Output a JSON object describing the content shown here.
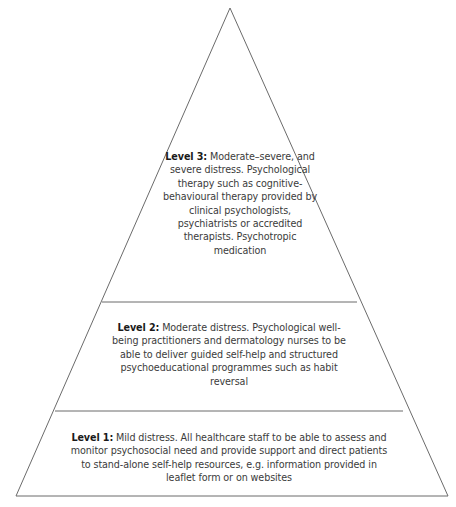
{
  "diagram": {
    "type": "pyramid",
    "colors": {
      "stroke": "#6b6b6b",
      "text": "#3b3b3b",
      "label": "#1a1a1a",
      "background": "#ffffff"
    },
    "levels": [
      {
        "id": "level-3",
        "position": "top",
        "label": "Level 3:",
        "text": " Moderate–severe, and severe distress. Psychological therapy such as cognitive-behavioural therapy provided by clinical psychologists, psychiatrists or accredited therapists. Psychotropic medication"
      },
      {
        "id": "level-2",
        "position": "middle",
        "label": "Level 2:",
        "text": " Moderate distress. Psychological well-being practitioners and dermatology nurses to be able to deliver guided self-help and structured psychoeducational programmes such as habit reversal"
      },
      {
        "id": "level-1",
        "position": "bottom",
        "label": "Level 1:",
        "text": " Mild distress. All healthcare staff to be able to assess and monitor psychosocial need and provide support and direct patients to stand-alone self-help resources, e.g. information provided in leaflet form or on websites"
      }
    ]
  }
}
